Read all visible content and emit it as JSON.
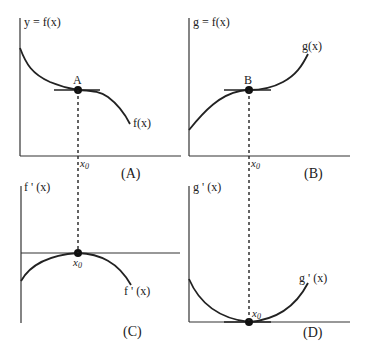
{
  "panels": {
    "A": {
      "y_axis_label": "y = f(x)",
      "curve_label": "f(x)",
      "point_label": "A",
      "x_label": "x",
      "x_sub": "0",
      "panel_label": "(A)"
    },
    "B": {
      "y_axis_label": "g = f(x)",
      "curve_label": "g(x)",
      "point_label": "B",
      "x_label": "x",
      "x_sub": "0",
      "panel_label": "(B)"
    },
    "C": {
      "y_axis_label": "f ' (x)",
      "curve_label": "f ' (x)",
      "x_label": "x",
      "x_sub": "0",
      "panel_label": "(C)"
    },
    "D": {
      "y_axis_label": "g ' (x)",
      "curve_label": "g ' (x)",
      "x_label": "x",
      "x_sub": "0",
      "panel_label": "(D)"
    }
  },
  "colors": {
    "line": "#222222",
    "background": "#ffffff"
  }
}
